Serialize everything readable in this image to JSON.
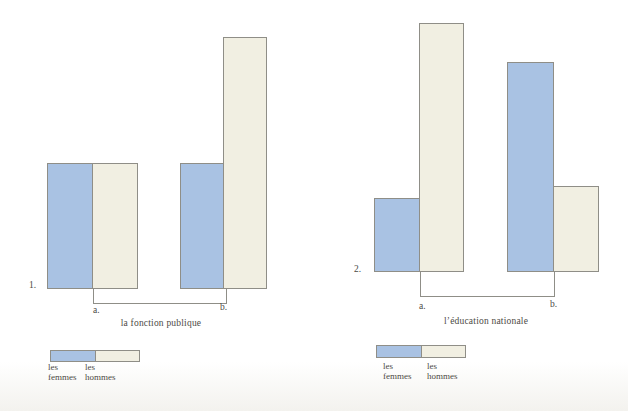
{
  "colors": {
    "femmes_blue": "#a9c2e3",
    "hommes_cream": "#f1efe2",
    "outline_gray": "#8f8e87",
    "text_gray": "#4c4a45"
  },
  "chart_data": [
    {
      "type": "bar",
      "item_label": "1.",
      "title": "la fonction publique",
      "categories": [
        "a.",
        "b."
      ],
      "series": [
        {
          "name": "les femmes",
          "color": "#a9c2e3",
          "values": [
            126,
            126
          ]
        },
        {
          "name": "les hommes",
          "color": "#f1efe2",
          "values": [
            126,
            252
          ]
        }
      ],
      "value_unit": "relative bar height in px (no numeric axis shown)",
      "grid": false,
      "legend_position": "below-left"
    },
    {
      "type": "bar",
      "item_label": "2.",
      "title": "l’éducation nationale",
      "categories": [
        "a.",
        "b."
      ],
      "series": [
        {
          "name": "les femmes",
          "color": "#a9c2e3",
          "values": [
            74,
            210
          ]
        },
        {
          "name": "les hommes",
          "color": "#f1efe2",
          "values": [
            249,
            86
          ]
        }
      ],
      "value_unit": "relative bar height in px (no numeric axis shown)",
      "grid": false,
      "legend_position": "below-left"
    }
  ]
}
